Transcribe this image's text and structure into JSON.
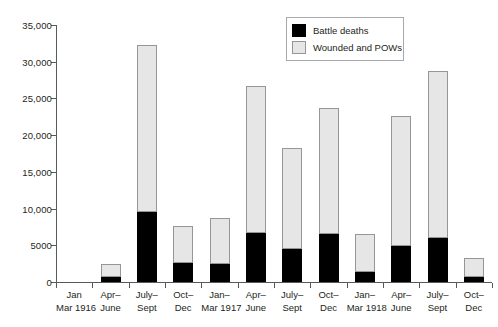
{
  "chart_data": {
    "type": "bar",
    "stacked": true,
    "title": "",
    "subtitle": "",
    "xlabel": "",
    "ylabel": "",
    "ylim": [
      0,
      35000
    ],
    "yticks": [
      0,
      5000,
      10000,
      15000,
      20000,
      25000,
      30000,
      35000
    ],
    "ytick_labels": [
      "0",
      "5000",
      "10,000",
      "15,000",
      "20,000",
      "25,000",
      "30,000",
      "35,000"
    ],
    "grid": false,
    "legend_position": "top-right",
    "categories": [
      "Jan Mar 1916",
      "Apr– June",
      "July– Sept",
      "Oct– Dec",
      "Jan– Mar 1917",
      "Apr– June",
      "July– Sept",
      "Oct– Dec",
      "Jan– Mar 1918",
      "Apr– June",
      "July– Sept",
      "Oct– Dec"
    ],
    "category_lines": [
      [
        "Jan",
        "Mar 1916"
      ],
      [
        "Apr–",
        "June"
      ],
      [
        "July–",
        "Sept"
      ],
      [
        "Oct–",
        "Dec"
      ],
      [
        "Jan–",
        "Mar 1917"
      ],
      [
        "Apr–",
        "June"
      ],
      [
        "July–",
        "Sept"
      ],
      [
        "Oct–",
        "Dec"
      ],
      [
        "Jan–",
        "Mar 1918"
      ],
      [
        "Apr–",
        "June"
      ],
      [
        "July–",
        "Sept"
      ],
      [
        "Oct–",
        "Dec"
      ]
    ],
    "series": [
      {
        "name": "Battle deaths",
        "color": "#000000",
        "values": [
          0,
          700,
          9500,
          2600,
          2500,
          6700,
          4500,
          6600,
          1300,
          4900,
          6000,
          700
        ]
      },
      {
        "name": "Wounded and POWs",
        "color": "#e6e6e6",
        "values": [
          0,
          1750,
          22800,
          5000,
          6200,
          20000,
          13700,
          17100,
          5200,
          17700,
          22700,
          2600
        ]
      }
    ],
    "totals": [
      0,
      2450,
      32300,
      7600,
      8700,
      26700,
      18200,
      23700,
      6500,
      22600,
      28700,
      3300
    ]
  },
  "legend": {
    "items": [
      {
        "label": "Battle deaths",
        "swatch": "black-square-swatch"
      },
      {
        "label": "Wounded and POWs",
        "swatch": "light-gray-square-swatch"
      }
    ]
  },
  "colors": {
    "battle_deaths": "#000000",
    "wounded_and_pows": "#e6e6e6",
    "axis": "#58595b",
    "text": "#231f20",
    "background": "#ffffff"
  }
}
